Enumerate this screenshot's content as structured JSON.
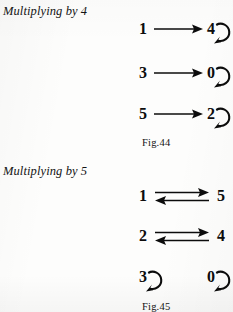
{
  "page": {
    "width": 233,
    "height": 312,
    "background_color": "#fdfdfc",
    "ink_color": "#0c0c0c"
  },
  "sections": [
    {
      "id": "multiplying-by-4",
      "title": "Multiplying by 4",
      "figure_caption": "Fig.44",
      "mappings": [
        {
          "source": "1",
          "target": "4",
          "arrow": "right",
          "target_self_loop": true
        },
        {
          "source": "3",
          "target": "0",
          "arrow": "right",
          "target_self_loop": true
        },
        {
          "source": "5",
          "target": "2",
          "arrow": "right",
          "target_self_loop": true
        }
      ]
    },
    {
      "id": "multiplying-by-5",
      "title": "Multiplying by 5",
      "figure_caption": "Fig.45",
      "mappings": [
        {
          "source": "1",
          "target": "5",
          "arrow": "both",
          "target_self_loop": false
        },
        {
          "source": "2",
          "target": "4",
          "arrow": "both",
          "target_self_loop": false
        }
      ],
      "fixed_points": [
        {
          "value": "3",
          "self_loop": true
        },
        {
          "value": "0",
          "self_loop": true
        }
      ]
    }
  ],
  "icons": {
    "right_arrow": "arrow-right-icon",
    "left_arrow": "arrow-left-icon",
    "self_loop": "self-loop-arrow-icon"
  }
}
